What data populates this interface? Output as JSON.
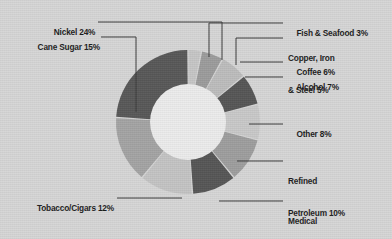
{
  "page": {
    "background_color": "#d6d6d6",
    "text_color": "#1c1c1c"
  },
  "chart_data": {
    "type": "pie",
    "variant": "donut",
    "title": "",
    "subtitle": "",
    "xlabel": "",
    "ylabel": "",
    "legend_position": "callout-labels",
    "grid": false,
    "units": "percent",
    "total": 100,
    "hole_color": "#ececec",
    "start_angle_deg": 0,
    "direction": "clockwise",
    "center": {
      "x": 188,
      "y": 122
    },
    "outer_radius": 72,
    "inner_radius": 38,
    "categories": [
      "Fish & Seafood",
      "Copper, Iron & Steel",
      "Coffee",
      "Alcohol",
      "Other",
      "Refined Petroleum",
      "Medical Products",
      "Tobacco/Cigars",
      "Cane Sugar",
      "Nickel"
    ],
    "values": [
      3,
      5,
      6,
      7,
      8,
      10,
      10,
      12,
      15,
      24
    ],
    "slices": [
      {
        "name": "Fish & Seafood",
        "value": 3,
        "label": "Fish & Seafood 3%",
        "color": "#c6c6c6"
      },
      {
        "name": "Copper, Iron & Steel",
        "value": 5,
        "label": "Copper, Iron & Steel 5%",
        "color": "#9c9c9c"
      },
      {
        "name": "Coffee",
        "value": 6,
        "label": "Coffee 6%",
        "color": "#bdbdbd"
      },
      {
        "name": "Alcohol",
        "value": 7,
        "label": "Alcohol 7%",
        "color": "#565656"
      },
      {
        "name": "Other",
        "value": 8,
        "label": "Other 8%",
        "color": "#c9c9c9"
      },
      {
        "name": "Refined Petroleum",
        "value": 10,
        "label": "Refined Petroleum 10%",
        "color": "#9e9e9e"
      },
      {
        "name": "Medical Products",
        "value": 10,
        "label": "Medical Products 10%",
        "color": "#565656"
      },
      {
        "name": "Tobacco/Cigars",
        "value": 12,
        "label": "Tobacco/Cigars 12%",
        "color": "#c4c4c4"
      },
      {
        "name": "Cane Sugar",
        "value": 15,
        "label": "Cane Sugar 15%",
        "color": "#a4a4a4"
      },
      {
        "name": "Nickel",
        "value": 24,
        "label": "Nickel 24%",
        "color": "#585858"
      }
    ]
  },
  "callouts": {
    "nickel": {
      "line1": "Nickel 24%",
      "line2": ""
    },
    "cane_sugar": {
      "line1": "Cane Sugar 15%",
      "line2": ""
    },
    "tobacco": {
      "line1": "Tobacco/Cigars 12%",
      "line2": ""
    },
    "fish": {
      "line1": "Fish & Seafood 3%",
      "line2": ""
    },
    "copper": {
      "line1": "Copper, Iron",
      "line2": "& Steel 5%"
    },
    "coffee": {
      "line1": "Coffee 6%",
      "line2": ""
    },
    "alcohol": {
      "line1": "Alcohol 7%",
      "line2": ""
    },
    "other": {
      "line1": "Other 8%",
      "line2": ""
    },
    "refined_petroleum": {
      "line1": "Refined",
      "line2": "Petroleum 10%"
    },
    "medical": {
      "line1": "Medical",
      "line2": "Products 10%"
    }
  }
}
